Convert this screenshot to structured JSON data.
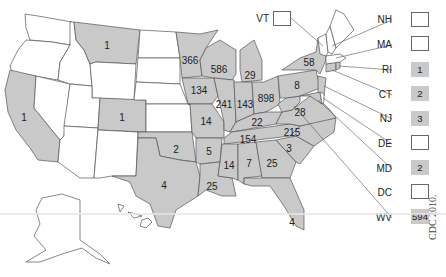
{
  "map": {
    "colors": {
      "reported": "#c9c9c9",
      "none": "#ffffff",
      "border": "#555555"
    },
    "states": {
      "WA": {
        "value": null
      },
      "OR": {
        "value": null
      },
      "CA": {
        "value": "1"
      },
      "NV": {
        "value": null
      },
      "ID": {
        "value": null
      },
      "MT": {
        "value": "1"
      },
      "WY": {
        "value": null
      },
      "UT": {
        "value": null
      },
      "AZ": {
        "value": null
      },
      "CO": {
        "value": "1"
      },
      "NM": {
        "value": null
      },
      "ND": {
        "value": null
      },
      "SD": {
        "value": null
      },
      "NE": {
        "value": null
      },
      "KS": {
        "value": null
      },
      "OK": {
        "value": "2"
      },
      "TX": {
        "value": "4"
      },
      "MN": {
        "value": "366"
      },
      "IA": {
        "value": "134"
      },
      "MO": {
        "value": "14"
      },
      "AR": {
        "value": "5"
      },
      "LA": {
        "value": "25"
      },
      "WI": {
        "value": "586"
      },
      "IL": {
        "value": "241"
      },
      "MI": {
        "value": "29"
      },
      "IN": {
        "value": "143"
      },
      "OH": {
        "value": "898"
      },
      "KY": {
        "value": "22"
      },
      "TN": {
        "value": "154"
      },
      "MS": {
        "value": "14"
      },
      "AL": {
        "value": "7"
      },
      "GA": {
        "value": "25"
      },
      "FL": {
        "value": "4"
      },
      "SC": {
        "value": "3"
      },
      "NC": {
        "value": "215"
      },
      "VA": {
        "value": "28"
      },
      "PA": {
        "value": "8"
      },
      "NY": {
        "value": "58"
      },
      "ME": {
        "value": null
      },
      "AK": {
        "value": null
      },
      "HI": {
        "value": null
      }
    },
    "callouts": [
      {
        "abbr": "VT",
        "value": ""
      },
      {
        "abbr": "NH",
        "value": ""
      },
      {
        "abbr": "MA",
        "value": ""
      },
      {
        "abbr": "RI",
        "value": "1"
      },
      {
        "abbr": "CT",
        "value": "2"
      },
      {
        "abbr": "NJ",
        "value": "3"
      },
      {
        "abbr": "DE",
        "value": ""
      },
      {
        "abbr": "MD",
        "value": "2"
      },
      {
        "abbr": "DC",
        "value": ""
      },
      {
        "abbr": "WV",
        "value": "594"
      }
    ],
    "source": "CDC 2010."
  }
}
